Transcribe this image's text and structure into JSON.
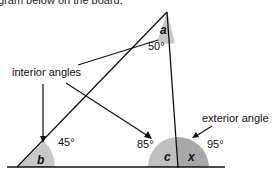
{
  "caption": {
    "partial_text": "gram below on the board."
  },
  "diagram": {
    "labels": {
      "interior": "interior angles",
      "exterior": "exterior angle"
    },
    "angles": {
      "a": {
        "name": "a",
        "value": "50°"
      },
      "b": {
        "name": "b",
        "value": "45°"
      },
      "c": {
        "name": "c",
        "value": "85°"
      },
      "x": {
        "name": "x",
        "value": "95°"
      }
    },
    "colors": {
      "angle_fill": "#c8c8c8",
      "exterior_fill": "#a8a8a8",
      "line": "#111111"
    }
  }
}
